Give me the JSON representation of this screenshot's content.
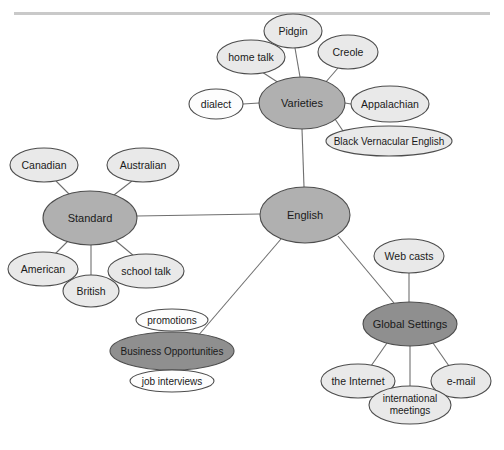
{
  "page": {
    "width": 504,
    "height": 450,
    "background": "#ffffff",
    "top_rule_color": "#c9c9c9",
    "cropped_caption_text": ""
  },
  "palette": {
    "hub_fill": "#b0b0b0",
    "dark_fill": "#8f8f8f",
    "light_fill": "#e9e9e9",
    "white_fill": "#fdfdfd",
    "node_stroke": "#4d4d4d",
    "edge_stroke": "#6f6f6f",
    "text_color": "#1a1a1a"
  },
  "chart_data": {
    "type": "diagram",
    "subtype": "concept-map",
    "root": "English",
    "nodes": [
      {
        "id": "english",
        "label": "English",
        "cx": 305,
        "cy": 215,
        "rx": 45,
        "ry": 28,
        "style": "hub",
        "font": "t-hub"
      },
      {
        "id": "varieties",
        "label": "Varieties",
        "cx": 302,
        "cy": 103,
        "rx": 43,
        "ry": 26,
        "style": "hub",
        "font": "t-hub"
      },
      {
        "id": "standard",
        "label": "Standard",
        "cx": 90,
        "cy": 218,
        "rx": 47,
        "ry": 27,
        "style": "hub",
        "font": "t-hub"
      },
      {
        "id": "business",
        "label": "Business Opportunities",
        "cx": 172,
        "cy": 351,
        "rx": 62,
        "ry": 19,
        "style": "dark",
        "font": "t-small"
      },
      {
        "id": "global",
        "label": "Global Settings",
        "cx": 410,
        "cy": 324,
        "rx": 47,
        "ry": 22,
        "style": "dark",
        "font": "t-hub"
      },
      {
        "id": "pidgin",
        "label": "Pidgin",
        "cx": 293,
        "cy": 31,
        "rx": 29,
        "ry": 17,
        "style": "light",
        "font": "t-leaf"
      },
      {
        "id": "hometalk",
        "label": "home talk",
        "cx": 251,
        "cy": 57,
        "rx": 34,
        "ry": 17,
        "style": "light",
        "font": "t-leaf"
      },
      {
        "id": "creole",
        "label": "Creole",
        "cx": 348,
        "cy": 52,
        "rx": 30,
        "ry": 17,
        "style": "light",
        "font": "t-leaf"
      },
      {
        "id": "dialect",
        "label": "dialect",
        "cx": 216,
        "cy": 104,
        "rx": 27,
        "ry": 15,
        "style": "white",
        "font": "t-leaf"
      },
      {
        "id": "appal",
        "label": "Appalachian",
        "cx": 390,
        "cy": 104,
        "rx": 39,
        "ry": 18,
        "style": "light",
        "font": "t-leaf"
      },
      {
        "id": "bve",
        "label": "Black Vernacular English",
        "cx": 389,
        "cy": 141,
        "rx": 63,
        "ry": 15,
        "style": "light",
        "font": "t-small"
      },
      {
        "id": "canadian",
        "label": "Canadian",
        "cx": 44,
        "cy": 165,
        "rx": 34,
        "ry": 17,
        "style": "light",
        "font": "t-leaf"
      },
      {
        "id": "australian",
        "label": "Australian",
        "cx": 143,
        "cy": 165,
        "rx": 36,
        "ry": 17,
        "style": "light",
        "font": "t-leaf"
      },
      {
        "id": "american",
        "label": "American",
        "cx": 43,
        "cy": 269,
        "rx": 35,
        "ry": 17,
        "style": "light",
        "font": "t-leaf"
      },
      {
        "id": "british",
        "label": "British",
        "cx": 91,
        "cy": 291,
        "rx": 28,
        "ry": 16,
        "style": "light",
        "font": "t-leaf"
      },
      {
        "id": "schooltalk",
        "label": "school talk",
        "cx": 146,
        "cy": 271,
        "rx": 38,
        "ry": 17,
        "style": "light",
        "font": "t-leaf"
      },
      {
        "id": "promotions",
        "label": "promotions",
        "cx": 172,
        "cy": 320,
        "rx": 36,
        "ry": 11,
        "style": "white",
        "font": "t-small"
      },
      {
        "id": "jobint",
        "label": "job interviews",
        "cx": 172,
        "cy": 381,
        "rx": 42,
        "ry": 11,
        "style": "white",
        "font": "t-small"
      },
      {
        "id": "webcasts",
        "label": "Web casts",
        "cx": 409,
        "cy": 256,
        "rx": 35,
        "ry": 17,
        "style": "light",
        "font": "t-leaf"
      },
      {
        "id": "internet",
        "label": "the Internet",
        "cx": 358,
        "cy": 381,
        "rx": 37,
        "ry": 17,
        "style": "light",
        "font": "t-leaf"
      },
      {
        "id": "email",
        "label": "e-mail",
        "cx": 461,
        "cy": 381,
        "rx": 30,
        "ry": 17,
        "style": "light",
        "font": "t-leaf"
      },
      {
        "id": "intlmeet",
        "label": "international meetings",
        "cx": 410,
        "cy": 405,
        "rx": 41,
        "ry": 19,
        "style": "light",
        "font": "t-small",
        "line1": "international",
        "line2": "meetings"
      }
    ],
    "edges": [
      {
        "from": "english",
        "to": "varieties",
        "x1": 304,
        "y1": 187,
        "x2": 302,
        "y2": 129
      },
      {
        "from": "english",
        "to": "standard",
        "x1": 260,
        "y1": 214,
        "x2": 137,
        "y2": 216
      },
      {
        "from": "english",
        "to": "business",
        "x1": 281,
        "y1": 239,
        "x2": 197,
        "y2": 337
      },
      {
        "from": "english",
        "to": "global",
        "x1": 338,
        "y1": 236,
        "x2": 394,
        "y2": 303
      },
      {
        "from": "varieties",
        "to": "pidgin",
        "x1": 300,
        "y1": 77,
        "x2": 295,
        "y2": 48
      },
      {
        "from": "varieties",
        "to": "hometalk",
        "x1": 279,
        "y1": 83,
        "x2": 262,
        "y2": 72
      },
      {
        "from": "varieties",
        "to": "creole",
        "x1": 325,
        "y1": 83,
        "x2": 338,
        "y2": 68
      },
      {
        "from": "varieties",
        "to": "dialect",
        "x1": 259,
        "y1": 103,
        "x2": 243,
        "y2": 104
      },
      {
        "from": "varieties",
        "to": "appal",
        "x1": 345,
        "y1": 103,
        "x2": 351,
        "y2": 104
      },
      {
        "from": "varieties",
        "to": "bve",
        "x1": 335,
        "y1": 119,
        "x2": 345,
        "y2": 134
      },
      {
        "from": "standard",
        "to": "canadian",
        "x1": 70,
        "y1": 195,
        "x2": 56,
        "y2": 181
      },
      {
        "from": "standard",
        "to": "australian",
        "x1": 114,
        "y1": 195,
        "x2": 132,
        "y2": 181
      },
      {
        "from": "standard",
        "to": "american",
        "x1": 68,
        "y1": 241,
        "x2": 55,
        "y2": 254
      },
      {
        "from": "standard",
        "to": "british",
        "x1": 91,
        "y1": 245,
        "x2": 91,
        "y2": 276
      },
      {
        "from": "standard",
        "to": "schooltalk",
        "x1": 116,
        "y1": 241,
        "x2": 134,
        "y2": 256
      },
      {
        "from": "global",
        "to": "webcasts",
        "x1": 409,
        "y1": 302,
        "x2": 409,
        "y2": 273
      },
      {
        "from": "global",
        "to": "internet",
        "x1": 387,
        "y1": 343,
        "x2": 371,
        "y2": 366
      },
      {
        "from": "global",
        "to": "email",
        "x1": 433,
        "y1": 343,
        "x2": 449,
        "y2": 366
      },
      {
        "from": "global",
        "to": "intlmeet",
        "x1": 410,
        "y1": 346,
        "x2": 410,
        "y2": 387
      }
    ],
    "groups": [
      {
        "hub": "Varieties",
        "children": [
          "Pidgin",
          "home talk",
          "Creole",
          "dialect",
          "Appalachian",
          "Black Vernacular English"
        ]
      },
      {
        "hub": "Standard",
        "children": [
          "Canadian",
          "Australian",
          "American",
          "British",
          "school talk"
        ]
      },
      {
        "hub": "Business Opportunities",
        "children": [
          "promotions",
          "job interviews"
        ]
      },
      {
        "hub": "Global Settings",
        "children": [
          "Web casts",
          "the Internet",
          "e-mail",
          "international meetings"
        ]
      }
    ]
  }
}
